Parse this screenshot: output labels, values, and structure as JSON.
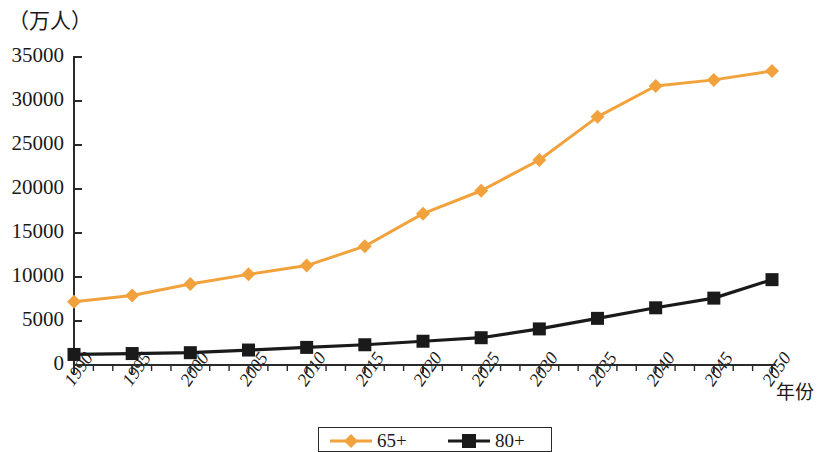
{
  "chart_data": {
    "type": "line",
    "title": "",
    "subtitle": "",
    "xlabel": "年份",
    "ylabel": "（万人）",
    "categories": [
      "1990",
      "1995",
      "2000",
      "2005",
      "2010",
      "2015",
      "2020",
      "2025",
      "2030",
      "2035",
      "2040",
      "2045",
      "2050"
    ],
    "x": [
      1990,
      1995,
      2000,
      2005,
      2010,
      2015,
      2020,
      2025,
      2030,
      2035,
      2040,
      2045,
      2050
    ],
    "series": [
      {
        "name": "65+",
        "color": "#F2A23C",
        "marker": "diamond",
        "values": [
          7200,
          7900,
          9200,
          10300,
          11300,
          13500,
          17200,
          19800,
          23300,
          28200,
          31700,
          32400,
          33400
        ]
      },
      {
        "name": "80+",
        "color": "#1A1A1A",
        "marker": "square",
        "values": [
          1200,
          1300,
          1400,
          1700,
          2000,
          2300,
          2700,
          3100,
          4100,
          5300,
          6500,
          7600,
          9700
        ]
      }
    ],
    "ylim": [
      0,
      35000
    ],
    "yticks": [
      0,
      5000,
      10000,
      15000,
      20000,
      25000,
      30000,
      35000
    ],
    "ytick_labels": [
      "0",
      "5000",
      "10000",
      "15000",
      "20000",
      "25000",
      "30000",
      "35000"
    ],
    "xtick_labels": [
      "1990",
      "1995",
      "2000",
      "2005",
      "2010",
      "2015",
      "2020",
      "2025",
      "2030",
      "2035",
      "2040",
      "2045",
      "2050"
    ],
    "grid": false,
    "legend_position": "bottom-center",
    "legend": [
      "65+",
      "80+"
    ],
    "axis_color": "#2A2A2A",
    "background": "#FFFFFF",
    "minor_ticks_per_interval": 2
  }
}
